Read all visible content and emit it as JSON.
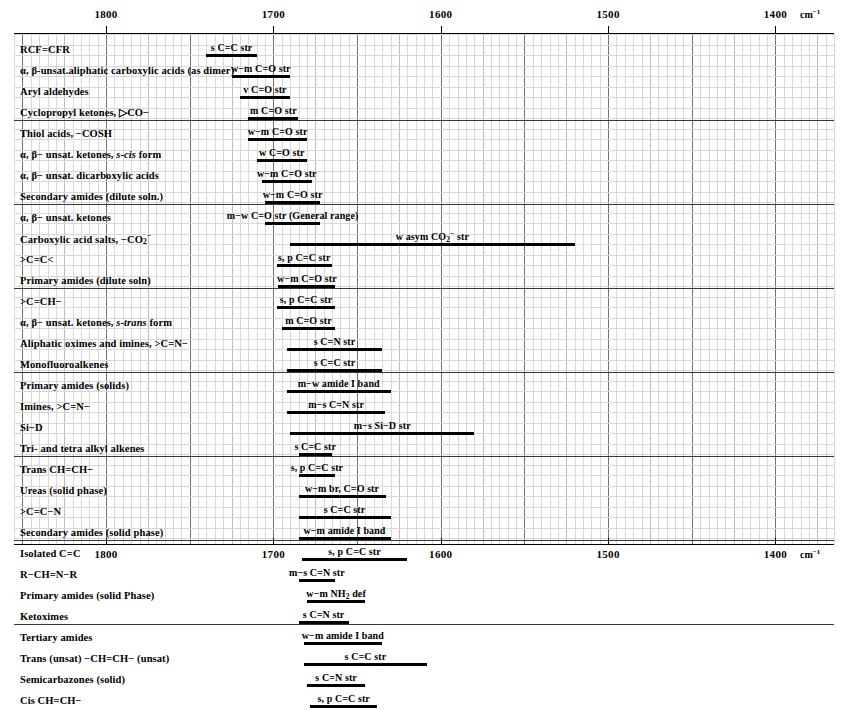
{
  "chart_data": {
    "type": "bar",
    "title": "",
    "xlabel": "cm-1",
    "unit_label": "cm",
    "unit_sup": "−1",
    "axis": {
      "min": 1855,
      "max": 1365,
      "ticks": [
        1800,
        1700,
        1600,
        1500,
        1400
      ],
      "tick_labels": [
        "1800",
        "1700",
        "1600",
        "1500",
        "1400"
      ],
      "minor_step": 5,
      "mid_step": 25,
      "major_step": 50,
      "grid": true,
      "direction": "descending"
    },
    "groups": [
      {
        "rows": [
          {
            "label": "RCF=CFR",
            "band": {
              "from": 1740,
              "to": 1710,
              "caption": "s C=C str"
            }
          },
          {
            "label": "α, β-unsat.aliphatic carboxylic acids (as dimer)",
            "band": {
              "from": 1725,
              "to": 1690,
              "caption": "w−m C=O str"
            }
          },
          {
            "label": "Aryl aldehydes",
            "band": {
              "from": 1720,
              "to": 1690,
              "caption": "v C=O str"
            }
          },
          {
            "label": "Cyclopropyl ketones, ▷CO−",
            "band": {
              "from": 1715,
              "to": 1685,
              "caption": "m C=O str"
            }
          }
        ]
      },
      {
        "rows": [
          {
            "label": "Thiol acids, −COSH",
            "band": {
              "from": 1715,
              "to": 1680,
              "caption": "w−m C=O str"
            }
          },
          {
            "label": "α, β− unsat. ketones, s-cis form",
            "band": {
              "from": 1710,
              "to": 1680,
              "caption": "w C=O str"
            }
          },
          {
            "label": "α, β− unsat. dicarboxylic acids",
            "band": {
              "from": 1707,
              "to": 1677,
              "caption": "w−m C=O str"
            }
          },
          {
            "label": "Secondary amides (dilute soln.)",
            "band": {
              "from": 1705,
              "to": 1672,
              "caption": "w−m C=O str"
            }
          }
        ]
      },
      {
        "rows": [
          {
            "label": "α, β− unsat. ketones",
            "band": {
              "from": 1705,
              "to": 1672,
              "caption": "m−w C=O str (General range)"
            }
          },
          {
            "label": "Carboxylic acid salts, −CO₂⁻",
            "band": {
              "from": 1690,
              "to": 1520,
              "caption": "w asym CO₂⁻ str"
            }
          },
          {
            "label": ">C=C<",
            "band": {
              "from": 1698,
              "to": 1665,
              "caption": "s, p C=C str"
            }
          },
          {
            "label": "Primary amides (dilute soln)",
            "band": {
              "from": 1697,
              "to": 1663,
              "caption": "w−m C=O str"
            }
          }
        ]
      },
      {
        "rows": [
          {
            "label": ">C=CH−",
            "band": {
              "from": 1698,
              "to": 1663,
              "caption": "s, p C=C str"
            }
          },
          {
            "label": "α, β− unsat. ketones, s-trans form",
            "band": {
              "from": 1695,
              "to": 1663,
              "caption": "m C=O str"
            }
          },
          {
            "label": "Aliphatic oximes and imines, >C=N−",
            "band": {
              "from": 1692,
              "to": 1635,
              "caption": "s C=N str"
            }
          },
          {
            "label": "Monofluoroalkenes",
            "band": {
              "from": 1692,
              "to": 1635,
              "caption": "s C=C str"
            }
          }
        ]
      },
      {
        "rows": [
          {
            "label": "Primary amides (solids)",
            "band": {
              "from": 1692,
              "to": 1630,
              "caption": "m−w amide I band"
            }
          },
          {
            "label": "Imines, >C=N−",
            "band": {
              "from": 1692,
              "to": 1633,
              "caption": "m−s C=N str"
            }
          },
          {
            "label": "Si−D",
            "band": {
              "from": 1690,
              "to": 1580,
              "caption": "m−s Si−D str"
            }
          },
          {
            "label": "Tri- and tetra alkyl alkenes",
            "band": {
              "from": 1685,
              "to": 1665,
              "caption": "s C=C str"
            }
          }
        ]
      },
      {
        "rows": [
          {
            "label": "Trans CH=CH−",
            "band": {
              "from": 1685,
              "to": 1663,
              "caption": "s, p C=C str"
            }
          },
          {
            "label": "Ureas (solid phase)",
            "band": {
              "from": 1685,
              "to": 1633,
              "caption": "w−m br, C=O str"
            }
          },
          {
            "label": ">C=C−N",
            "band": {
              "from": 1685,
              "to": 1630,
              "caption": "s C=C str"
            }
          },
          {
            "label": "Secondary amides (solid phase)",
            "band": {
              "from": 1685,
              "to": 1630,
              "caption": "w−m amide I band"
            }
          }
        ]
      },
      {
        "rows": [
          {
            "label": "Isolated C=C",
            "band": {
              "from": 1683,
              "to": 1620,
              "caption": "s, p C=C str"
            }
          },
          {
            "label": "R−CH=N−R",
            "band": {
              "from": 1685,
              "to": 1663,
              "caption": "m−s C=N str"
            }
          },
          {
            "label": "Primary amides (solid Phase)",
            "band": {
              "from": 1680,
              "to": 1645,
              "caption": "w−m NH₂ def"
            }
          },
          {
            "label": "Ketoximes",
            "band": {
              "from": 1685,
              "to": 1655,
              "caption": "s C=N str"
            }
          }
        ]
      },
      {
        "rows": [
          {
            "label": "Tertiary amides",
            "band": {
              "from": 1682,
              "to": 1635,
              "caption": "w−m amide I band"
            }
          },
          {
            "label": "Trans (unsat) −CH=CH− (unsat)",
            "band": {
              "from": 1682,
              "to": 1608,
              "caption": "s C=C str"
            }
          },
          {
            "label": "Semicarbazones (solid)",
            "band": {
              "from": 1680,
              "to": 1645,
              "caption": "s C=N str"
            }
          },
          {
            "label": "Cis CH=CH−",
            "band": {
              "from": 1678,
              "to": 1638,
              "caption": "s, p C=C str"
            }
          }
        ]
      }
    ]
  }
}
